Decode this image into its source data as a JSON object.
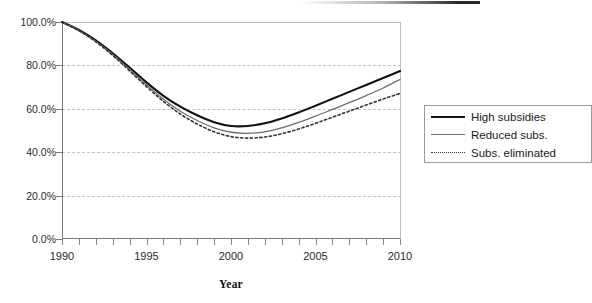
{
  "chart_data": {
    "type": "line",
    "title": "",
    "xlabel": "Year",
    "ylabel": "",
    "xlim": [
      1990,
      2010
    ],
    "ylim": [
      0,
      1.0
    ],
    "grid": true,
    "grid_axis": "y",
    "legend_position": "right",
    "x": [
      1990,
      1991,
      1992,
      1993,
      1994,
      1995,
      1996,
      1997,
      1998,
      1999,
      2000,
      2001,
      2002,
      2003,
      2004,
      2005,
      2006,
      2007,
      2008,
      2009,
      2010
    ],
    "y_tick_labels": [
      "100.0%",
      "80.0%",
      "60.0%",
      "40.0%",
      "20.0%",
      "0.0%"
    ],
    "y_tick_values": [
      1.0,
      0.8,
      0.6,
      0.4,
      0.2,
      0.0
    ],
    "x_tick_labels": [
      "1990",
      "1995",
      "2000",
      "2005",
      "2010"
    ],
    "x_tick_values": [
      1990,
      1995,
      2000,
      2005,
      2010
    ],
    "x_minor_ticks_every": 1,
    "series": [
      {
        "name": "High subsidies",
        "style": "solid",
        "width": 2.1,
        "color": "#111111",
        "values": [
          1.0,
          0.963,
          0.915,
          0.856,
          0.79,
          0.722,
          0.66,
          0.61,
          0.57,
          0.538,
          0.521,
          0.521,
          0.533,
          0.555,
          0.583,
          0.614,
          0.646,
          0.678,
          0.71,
          0.742,
          0.774
        ]
      },
      {
        "name": "Reduced subs.",
        "style": "solid",
        "width": 1.3,
        "color": "#6e6e6e",
        "values": [
          1.0,
          0.961,
          0.911,
          0.85,
          0.781,
          0.71,
          0.644,
          0.589,
          0.546,
          0.512,
          0.492,
          0.487,
          0.494,
          0.512,
          0.537,
          0.566,
          0.597,
          0.628,
          0.661,
          0.696,
          0.735
        ]
      },
      {
        "name": "Subs. eliminated",
        "style": "dotted",
        "width": 1.6,
        "color": "#333333",
        "values": [
          1.0,
          0.96,
          0.909,
          0.846,
          0.775,
          0.702,
          0.634,
          0.576,
          0.53,
          0.494,
          0.472,
          0.465,
          0.47,
          0.485,
          0.507,
          0.533,
          0.561,
          0.589,
          0.617,
          0.645,
          0.671
        ]
      }
    ]
  },
  "axis": {
    "x_title": "Year"
  },
  "legend": {
    "items": [
      {
        "label": "High subsidies",
        "key": "solid-thick-line-key"
      },
      {
        "label": "Reduced subs.",
        "key": "solid-thin-line-key"
      },
      {
        "label": "Subs. eliminated",
        "key": "dotted-line-key"
      }
    ]
  }
}
